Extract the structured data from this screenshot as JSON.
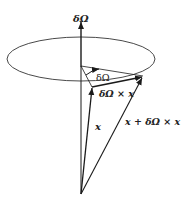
{
  "diagram": {
    "labels": {
      "axis": "δΩ",
      "angle": "δΩ",
      "cross": "δΩ × x",
      "vector_x": "x",
      "vector_sum": "x + δΩ × x"
    },
    "colors": {
      "stroke": "#1a1a1a",
      "background": "#ffffff"
    }
  }
}
